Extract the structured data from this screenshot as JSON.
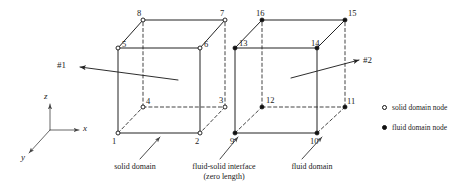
{
  "figure": {
    "background_color": "#ffffff",
    "line_color": "#222222",
    "node_open_fill": "#ffffff",
    "node_filled_fill": "#111111"
  },
  "axes": {
    "origin": {
      "x": 50,
      "y": 130
    },
    "items": [
      {
        "name": "z",
        "label": "z",
        "tip_x": 50,
        "tip_y": 104,
        "label_x": 44,
        "label_y": 92
      },
      {
        "name": "x",
        "label": "x",
        "tip_x": 79,
        "tip_y": 130,
        "label_x": 83,
        "label_y": 124
      },
      {
        "name": "y",
        "label": "y",
        "tip_x": 29,
        "tip_y": 153,
        "label_x": 21,
        "label_y": 153
      }
    ]
  },
  "elements": [
    {
      "id": "element-1",
      "ref_label": "#1",
      "domain": "solid",
      "marker": "open",
      "ref_label_x": 57,
      "ref_label_y": 61,
      "arrow_tip": {
        "x": 80,
        "y": 67
      },
      "arrow_tail": {
        "x": 178,
        "y": 80
      }
    },
    {
      "id": "element-2",
      "ref_label": "#2",
      "domain": "fluid",
      "marker": "filled",
      "ref_label_x": 363,
      "ref_label_y": 56,
      "arrow_tip": {
        "x": 359,
        "y": 60
      },
      "arrow_tail": {
        "x": 291,
        "y": 78
      }
    }
  ],
  "nodes": [
    {
      "id": 1,
      "label": "1",
      "x": 118,
      "y": 133,
      "marker": "open",
      "label_x": 112,
      "label_y": 137
    },
    {
      "id": 2,
      "label": "2",
      "x": 200,
      "y": 133,
      "marker": "open",
      "label_x": 195,
      "label_y": 137
    },
    {
      "id": 3,
      "label": "3",
      "x": 225,
      "y": 107,
      "marker": "open",
      "label_x": 219,
      "label_y": 96
    },
    {
      "id": 4,
      "label": "4",
      "x": 143,
      "y": 107,
      "marker": "open",
      "label_x": 146,
      "label_y": 97
    },
    {
      "id": 5,
      "label": "5",
      "x": 118,
      "y": 48,
      "marker": "open",
      "label_x": 122,
      "label_y": 40
    },
    {
      "id": 6,
      "label": "6",
      "x": 200,
      "y": 48,
      "marker": "open",
      "label_x": 204,
      "label_y": 40
    },
    {
      "id": 7,
      "label": "7",
      "x": 225,
      "y": 20,
      "marker": "open",
      "label_x": 220,
      "label_y": 9
    },
    {
      "id": 8,
      "label": "8",
      "x": 143,
      "y": 20,
      "marker": "open",
      "label_x": 137,
      "label_y": 9
    },
    {
      "id": 9,
      "label": "9",
      "x": 235,
      "y": 133,
      "marker": "filled",
      "label_x": 230,
      "label_y": 137
    },
    {
      "id": 10,
      "label": "10",
      "x": 317,
      "y": 133,
      "marker": "filled",
      "label_x": 310,
      "label_y": 137
    },
    {
      "id": 11,
      "label": "11",
      "x": 345,
      "y": 107,
      "marker": "filled",
      "label_x": 347,
      "label_y": 97
    },
    {
      "id": 12,
      "label": "12",
      "x": 262,
      "y": 107,
      "marker": "filled",
      "label_x": 266,
      "label_y": 96
    },
    {
      "id": 13,
      "label": "13",
      "x": 235,
      "y": 48,
      "marker": "filled",
      "label_x": 239,
      "label_y": 39
    },
    {
      "id": 14,
      "label": "14",
      "x": 317,
      "y": 48,
      "marker": "filled",
      "label_x": 311,
      "label_y": 39
    },
    {
      "id": 15,
      "label": "15",
      "x": 345,
      "y": 20,
      "marker": "filled",
      "label_x": 348,
      "label_y": 9
    },
    {
      "id": 16,
      "label": "16",
      "x": 262,
      "y": 20,
      "marker": "filled",
      "label_x": 256,
      "label_y": 9
    }
  ],
  "edges_solid": [
    {
      "name": "edge-1-2",
      "from": 1,
      "to": 2
    },
    {
      "name": "edge-2-6",
      "from": 2,
      "to": 6
    },
    {
      "name": "edge-6-5",
      "from": 6,
      "to": 5
    },
    {
      "name": "edge-5-1",
      "from": 5,
      "to": 1
    },
    {
      "name": "edge-5-8",
      "from": 5,
      "to": 8
    },
    {
      "name": "edge-6-7",
      "from": 6,
      "to": 7
    },
    {
      "name": "edge-8-7",
      "from": 8,
      "to": 7
    },
    {
      "name": "edge-9-10",
      "from": 9,
      "to": 10
    },
    {
      "name": "edge-10-14",
      "from": 10,
      "to": 14
    },
    {
      "name": "edge-14-13",
      "from": 14,
      "to": 13
    },
    {
      "name": "edge-13-9",
      "from": 13,
      "to": 9
    },
    {
      "name": "edge-13-16",
      "from": 13,
      "to": 16
    },
    {
      "name": "edge-14-15",
      "from": 14,
      "to": 15
    },
    {
      "name": "edge-16-15",
      "from": 16,
      "to": 15
    }
  ],
  "edges_dashed": [
    {
      "name": "edge-1-4",
      "from": 1,
      "to": 4
    },
    {
      "name": "edge-4-3",
      "from": 4,
      "to": 3
    },
    {
      "name": "edge-3-2",
      "from": 3,
      "to": 2
    },
    {
      "name": "edge-4-8",
      "from": 4,
      "to": 8
    },
    {
      "name": "edge-3-7",
      "from": 3,
      "to": 7
    },
    {
      "name": "edge-9-12",
      "from": 9,
      "to": 12
    },
    {
      "name": "edge-12-11",
      "from": 12,
      "to": 11
    },
    {
      "name": "edge-11-10",
      "from": 11,
      "to": 10
    },
    {
      "name": "edge-12-16",
      "from": 12,
      "to": 16
    },
    {
      "name": "edge-11-15",
      "from": 11,
      "to": 15
    }
  ],
  "callouts": [
    {
      "name": "callout-solid-domain",
      "lines": [
        "solid domain"
      ],
      "text_x": 104,
      "text_y": 162,
      "text_width": 62,
      "arrow_tail": {
        "x": 140,
        "y": 159
      },
      "arrow_tip": {
        "x": 160,
        "y": 137
      }
    },
    {
      "name": "callout-fluid-solid-interface",
      "lines": [
        "fluid-solid interface",
        "(zero length)"
      ],
      "text_x": 176,
      "text_y": 162,
      "text_width": 96,
      "arrow_tail": {
        "x": 220,
        "y": 159
      },
      "arrow_tip": {
        "x": 238,
        "y": 137
      }
    },
    {
      "name": "callout-fluid-domain",
      "lines": [
        "fluid domain"
      ],
      "text_x": 281,
      "text_y": 162,
      "text_width": 62,
      "arrow_tail": {
        "x": 302,
        "y": 159
      },
      "arrow_tip": {
        "x": 322,
        "y": 137
      }
    }
  ],
  "legend": {
    "x": 382,
    "items": [
      {
        "name": "legend-solid-domain-node",
        "label": "solid domain node",
        "marker": "open",
        "y": 104
      },
      {
        "name": "legend-fluid-domain-node",
        "label": "fluid domain node",
        "marker": "filled",
        "y": 124
      }
    ]
  }
}
